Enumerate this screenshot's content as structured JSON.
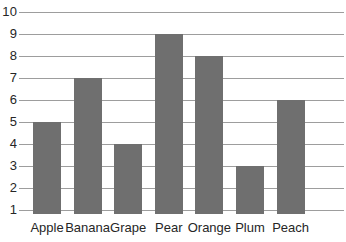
{
  "chart_data": {
    "type": "bar",
    "title": "",
    "subtitle": "",
    "xlabel": "",
    "ylabel": "",
    "categories": [
      "Apple",
      "Banana",
      "Grape",
      "Pear",
      "Orange",
      "Plum",
      "Peach"
    ],
    "values": [
      5,
      7,
      4,
      9,
      8,
      3,
      6
    ],
    "ylim": [
      1,
      10
    ],
    "ytick_labels": [
      "1",
      "2",
      "3",
      "4",
      "5",
      "6",
      "7",
      "8",
      "9",
      "10"
    ],
    "ytick_values": [
      1,
      2,
      3,
      4,
      5,
      6,
      7,
      8,
      9,
      10
    ],
    "grid": true,
    "grid_orientation": "horizontal",
    "legend": false,
    "legend_position": "none",
    "bar_color": "#6f6f6f",
    "grid_color": "#9d9d9d",
    "label_color": "#262626",
    "background_color": "#ffffff"
  }
}
